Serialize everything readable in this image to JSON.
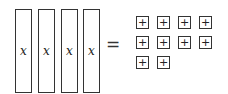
{
  "diagram": {
    "type": "algebra-tiles-equation",
    "left_side": {
      "tiles": [
        {
          "kind": "x-tile",
          "label": "x"
        },
        {
          "kind": "x-tile",
          "label": "x"
        },
        {
          "kind": "x-tile",
          "label": "x"
        },
        {
          "kind": "x-tile",
          "label": "x"
        }
      ]
    },
    "operator": "=",
    "right_side": {
      "tiles": [
        {
          "kind": "unit-tile",
          "label": "+"
        },
        {
          "kind": "unit-tile",
          "label": "+"
        },
        {
          "kind": "unit-tile",
          "label": "+"
        },
        {
          "kind": "unit-tile",
          "label": "+"
        },
        {
          "kind": "unit-tile",
          "label": "+"
        },
        {
          "kind": "unit-tile",
          "label": "+"
        },
        {
          "kind": "unit-tile",
          "label": "+"
        },
        {
          "kind": "unit-tile",
          "label": "+"
        },
        {
          "kind": "unit-tile",
          "label": "+"
        },
        {
          "kind": "unit-tile",
          "label": "+"
        }
      ]
    },
    "colors": {
      "stroke": "#333333",
      "fill": "#ffffff"
    }
  }
}
